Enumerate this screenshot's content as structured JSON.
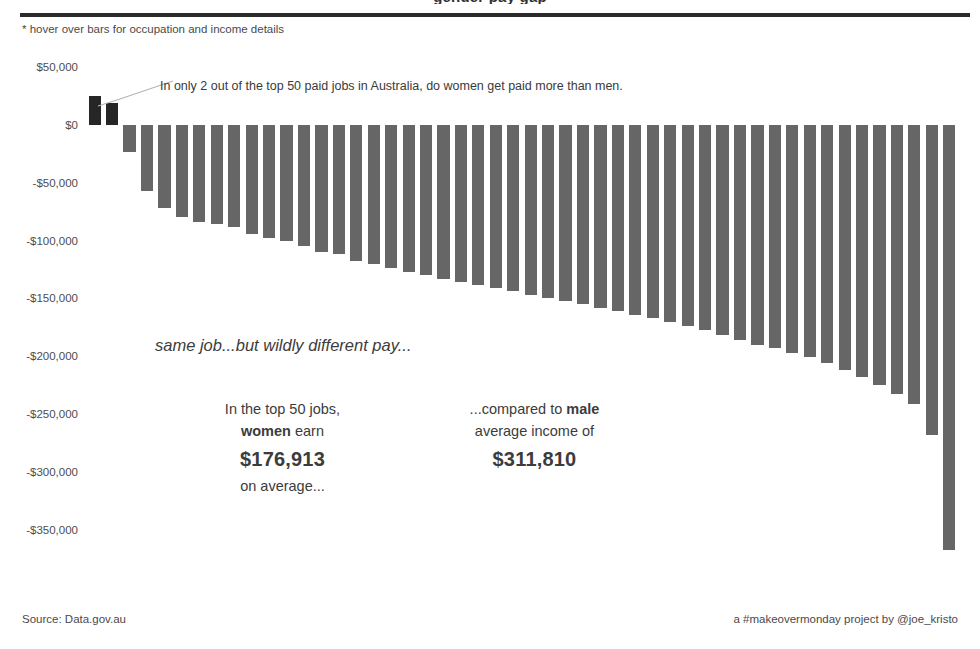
{
  "header": {
    "clipped_title": "gender pay gap",
    "hover_hint": "* hover over bars for occupation and income details"
  },
  "annotation": {
    "callout": "In only 2 out of the top 50 paid jobs in Australia, do women get paid more than men."
  },
  "narrative": {
    "tagline": "same job...but wildly different pay...",
    "women": {
      "line1": "In the top 50 jobs,",
      "line2_bold": "women",
      "line2_rest": " earn",
      "amount": "$176,913",
      "line4": "on average..."
    },
    "men": {
      "line1_rest": "...compared to ",
      "line1_bold": "male",
      "line2": "average income of",
      "amount": "$311,810"
    }
  },
  "footer": {
    "source": "Source: Data.gov.au",
    "credit": "a #makeovermonday project by @joe_kristo"
  },
  "colors": {
    "bar_negative": "#666666",
    "bar_positive": "#262626",
    "rule": "#2b2b2b",
    "text": "#3c3c3c",
    "background": "#ffffff"
  },
  "chart_data": {
    "type": "bar",
    "title": "gender pay gap",
    "subtitle": "* hover over bars for occupation and income details",
    "xlabel": "",
    "ylabel": "",
    "ylim": [
      -375000,
      50000
    ],
    "grid": false,
    "legend": null,
    "y_ticks": [
      50000,
      0,
      -50000,
      -100000,
      -150000,
      -200000,
      -250000,
      -300000,
      -350000
    ],
    "y_tick_labels": [
      "$50,000",
      "$0",
      "-$50,000",
      "-$100,000",
      "-$150,000",
      "-$200,000",
      "-$250,000",
      "-$300,000",
      "-$350,000"
    ],
    "series_name": "Difference between female and male average income (top 50 paid occupations)",
    "categories": [
      "Job 1",
      "Job 2",
      "Job 3",
      "Job 4",
      "Job 5",
      "Job 6",
      "Job 7",
      "Job 8",
      "Job 9",
      "Job 10",
      "Job 11",
      "Job 12",
      "Job 13",
      "Job 14",
      "Job 15",
      "Job 16",
      "Job 17",
      "Job 18",
      "Job 19",
      "Job 20",
      "Job 21",
      "Job 22",
      "Job 23",
      "Job 24",
      "Job 25",
      "Job 26",
      "Job 27",
      "Job 28",
      "Job 29",
      "Job 30",
      "Job 31",
      "Job 32",
      "Job 33",
      "Job 34",
      "Job 35",
      "Job 36",
      "Job 37",
      "Job 38",
      "Job 39",
      "Job 40",
      "Job 41",
      "Job 42",
      "Job 43",
      "Job 44",
      "Job 45",
      "Job 46",
      "Job 47",
      "Job 48",
      "Job 49",
      "Job 50"
    ],
    "values": [
      25000,
      19000,
      -23000,
      -57000,
      -72000,
      -80000,
      -84000,
      -86000,
      -88000,
      -94000,
      -98000,
      -100000,
      -105000,
      -110000,
      -112000,
      -118000,
      -120000,
      -124000,
      -127000,
      -130000,
      -133000,
      -136000,
      -138000,
      -141000,
      -144000,
      -147000,
      -150000,
      -152000,
      -155000,
      -158000,
      -161000,
      -164000,
      -167000,
      -170000,
      -174000,
      -177000,
      -182000,
      -186000,
      -190000,
      -193000,
      -197000,
      -201000,
      -206000,
      -212000,
      -218000,
      -225000,
      -233000,
      -241000,
      -268000,
      -368000
    ],
    "annotations": [
      {
        "text": "In only 2 out of the top 50 paid jobs in Australia, do women get paid more than men.",
        "points_to": "Job 2"
      },
      {
        "text": "same job...but wildly different pay..."
      },
      {
        "text": "In the top 50 jobs, women earn $176,913 on average..."
      },
      {
        "text": "...compared to male average income of $311,810"
      }
    ],
    "source": "Source: Data.gov.au",
    "credit": "a #makeovermonday project by @joe_kristo"
  }
}
